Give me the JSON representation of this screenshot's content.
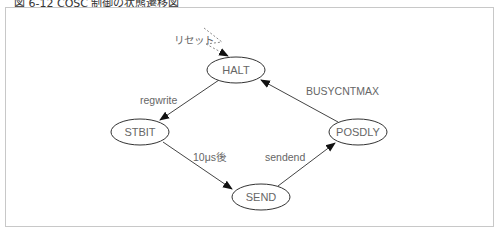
{
  "figure": {
    "title": "図 6-12 COSC 制御の状態遷移図"
  },
  "diagram": {
    "type": "state-transition",
    "nodes": [
      {
        "id": "HALT",
        "label": "HALT",
        "cx": 236,
        "cy": 70
      },
      {
        "id": "STBIT",
        "label": "STBIT",
        "cx": 140,
        "cy": 132
      },
      {
        "id": "SEND",
        "label": "SEND",
        "cx": 261,
        "cy": 197
      },
      {
        "id": "POSDLY",
        "label": "POSDLY",
        "cx": 358,
        "cy": 132
      }
    ],
    "edges": [
      {
        "from": "reset",
        "to": "HALT",
        "label": "リセット",
        "style": "dotted"
      },
      {
        "from": "HALT",
        "to": "STBIT",
        "label": "regwrite",
        "style": "solid"
      },
      {
        "from": "STBIT",
        "to": "SEND",
        "label": "10μs後",
        "style": "solid"
      },
      {
        "from": "SEND",
        "to": "POSDLY",
        "label": "sendend",
        "style": "solid"
      },
      {
        "from": "POSDLY",
        "to": "HALT",
        "label": "BUSYCNTMAX",
        "style": "solid"
      }
    ],
    "colors": {
      "line": "#444444",
      "dotted": "#888888",
      "text": "#666666",
      "frame": "#c8c8c8"
    }
  }
}
